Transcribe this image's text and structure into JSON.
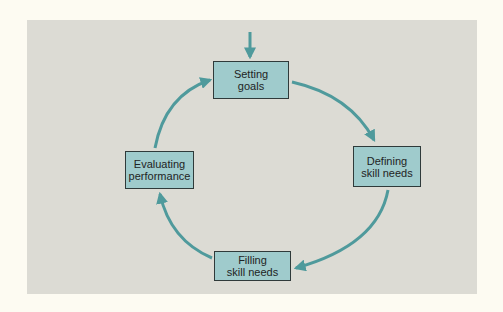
{
  "diagram": {
    "type": "cycle",
    "colors": {
      "background": "#fdfbf2",
      "panel": "#dcdbd4",
      "box_fill": "#9fcbcc",
      "box_border": "#2f3a3a",
      "arrow": "#4f9a9c"
    },
    "entry_arrow": {
      "target": "setting_goals"
    },
    "nodes": {
      "setting_goals": {
        "label": "Setting\ngoals"
      },
      "defining_skill_needs": {
        "label": "Defining\nskill needs"
      },
      "filling_skill_needs": {
        "label": "Filling\nskill needs"
      },
      "evaluating_performance": {
        "label": "Evaluating\nperformance"
      }
    },
    "edges": [
      {
        "from": "setting_goals",
        "to": "defining_skill_needs"
      },
      {
        "from": "defining_skill_needs",
        "to": "filling_skill_needs"
      },
      {
        "from": "filling_skill_needs",
        "to": "evaluating_performance"
      },
      {
        "from": "evaluating_performance",
        "to": "setting_goals"
      }
    ]
  }
}
